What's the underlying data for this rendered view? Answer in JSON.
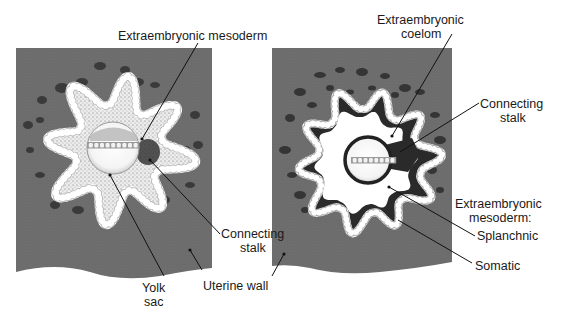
{
  "figure": {
    "panels": [
      {
        "id": "left",
        "description": "Early stage: chorionic cavity filled with extraembryonic mesoderm",
        "labels": {
          "extraembryonic_mesoderm": "Extraembryonic mesoderm",
          "connecting_stalk_line1": "Connecting",
          "connecting_stalk_line2": "stalk",
          "yolk_sac_line1": "Yolk",
          "yolk_sac_line2": "sac"
        }
      },
      {
        "id": "right",
        "description": "Later stage: extraembryonic coelom forms, mesoderm splits",
        "labels": {
          "extraembryonic_coelom_line1": "Extraembryonic",
          "extraembryonic_coelom_line2": "coelom",
          "connecting_stalk_line1": "Connecting",
          "connecting_stalk_line2": "stalk",
          "extraembryonic_mesoderm_line1": "Extraembryonic",
          "extraembryonic_mesoderm_line2": "mesoderm:",
          "splanchnic": "Splanchnic",
          "somatic": "Somatic"
        }
      }
    ],
    "shared_labels": {
      "uterine_wall": "Uterine wall"
    },
    "colors": {
      "uterine_tissue": "#6e6e6e",
      "tissue_blobs": "#3c3c3c",
      "trophoblast_cells": "#ffffff",
      "mesoderm_stipple": "#e9e9e9",
      "mesoderm_dark": "#2b2b2b",
      "coelom": "#ffffff",
      "embryo_disc": "#bdbdbd",
      "label_text": "#1a1a1a"
    }
  }
}
